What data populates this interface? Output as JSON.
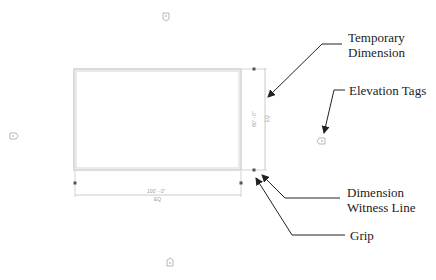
{
  "diagram": {
    "colors": {
      "room_outline": "#b8b8b8",
      "dimension_line": "#c4c4c4",
      "grip": "#555555",
      "callout": "#222222",
      "tag": "#9a9a9a"
    },
    "room": {
      "x": 74,
      "y": 69,
      "width": 167,
      "height": 101
    },
    "dimensions": {
      "horizontal": {
        "value": "100' - 0\"",
        "eq": "EQ"
      },
      "vertical": {
        "value": "60' - 0\"",
        "eq": "EQ"
      }
    },
    "elevation_tags": [
      {
        "position": "top",
        "x": 166,
        "y": 16
      },
      {
        "position": "left",
        "x": 13,
        "y": 136
      },
      {
        "position": "right",
        "x": 321,
        "y": 140
      },
      {
        "position": "bottom",
        "x": 170,
        "y": 262
      }
    ],
    "callouts": [
      {
        "id": "temporary-dimension",
        "line1": "Temporary",
        "line2": "Dimension"
      },
      {
        "id": "elevation-tags",
        "line1": "Elevation Tags"
      },
      {
        "id": "dimension-witness-line",
        "line1": "Dimension",
        "line2": "Witness Line"
      },
      {
        "id": "grip",
        "line1": "Grip"
      }
    ]
  }
}
